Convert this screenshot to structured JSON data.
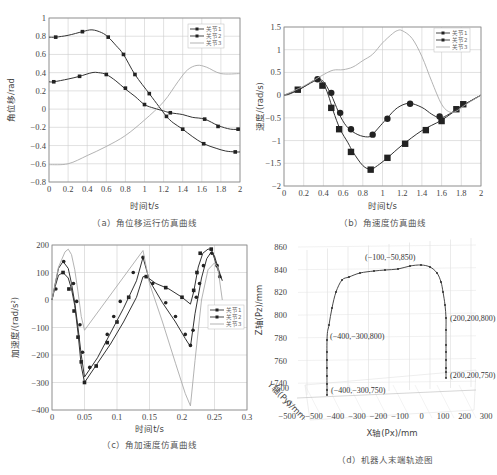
{
  "chart_data": [
    {
      "id": "a",
      "type": "line",
      "title": "角位移运行仿真曲线",
      "caption": "（a）角位移运行仿真曲线",
      "xlabel": "时间t/s",
      "ylabel": "角位移/rad",
      "xlim": [
        0,
        2
      ],
      "ylim": [
        -0.8,
        1
      ],
      "xticks": [
        "0",
        "0.2",
        "0.4",
        "0.6",
        "0.8",
        "1",
        "1.2",
        "1.4",
        "1.6",
        "1.8",
        "2"
      ],
      "yticks": [
        "1",
        "0.8",
        "0.6",
        "0.4",
        "0.2",
        "0",
        "−0.2",
        "−0.4",
        "−0.6",
        "−0.8"
      ],
      "grid": true,
      "legend": {
        "position": "upper-right",
        "entries": [
          "关节1",
          "关节2",
          "关节3"
        ]
      },
      "series": [
        {
          "name": "关节1",
          "marker": "square",
          "x": [
            0.0,
            0.07,
            0.2,
            0.35,
            0.45,
            0.55,
            0.62,
            0.7,
            0.78,
            0.9,
            1.05,
            1.15,
            1.23,
            1.3,
            1.4,
            1.5,
            1.62,
            1.75,
            1.85,
            1.95,
            2.0
          ],
          "y": [
            0.79,
            0.79,
            0.81,
            0.85,
            0.87,
            0.84,
            0.79,
            0.7,
            0.6,
            0.38,
            0.17,
            0.03,
            -0.08,
            -0.15,
            -0.22,
            -0.3,
            -0.38,
            -0.43,
            -0.46,
            -0.47,
            -0.47
          ],
          "markers_x": [
            0.07,
            0.35,
            0.62,
            0.78,
            0.9,
            1.05,
            1.23,
            1.4,
            1.62,
            1.95
          ],
          "markers_y": [
            0.79,
            0.85,
            0.79,
            0.6,
            0.38,
            0.17,
            -0.08,
            -0.22,
            -0.38,
            -0.47
          ]
        },
        {
          "name": "关节2",
          "marker": "square",
          "x": [
            0.0,
            0.05,
            0.2,
            0.32,
            0.45,
            0.52,
            0.6,
            0.7,
            0.8,
            0.9,
            1.0,
            1.1,
            1.2,
            1.27,
            1.4,
            1.5,
            1.63,
            1.77,
            1.9,
            2.0
          ],
          "y": [
            0.3,
            0.3,
            0.33,
            0.36,
            0.4,
            0.4,
            0.38,
            0.31,
            0.22,
            0.14,
            0.05,
            0.01,
            -0.02,
            -0.04,
            -0.06,
            -0.09,
            -0.11,
            -0.18,
            -0.22,
            -0.22
          ],
          "markers_x": [
            0.05,
            0.32,
            0.6,
            0.8,
            1.0,
            1.27,
            1.63,
            1.77,
            1.98
          ],
          "markers_y": [
            0.3,
            0.36,
            0.38,
            0.23,
            0.05,
            -0.04,
            -0.11,
            -0.19,
            -0.22
          ]
        },
        {
          "name": "关节3",
          "marker": "none",
          "x": [
            0.0,
            0.2,
            0.4,
            0.6,
            0.8,
            1.0,
            1.2,
            1.35,
            1.45,
            1.55,
            1.65,
            1.8,
            2.0
          ],
          "y": [
            -0.61,
            -0.6,
            -0.51,
            -0.41,
            -0.29,
            -0.12,
            0.08,
            0.3,
            0.43,
            0.48,
            0.46,
            0.39,
            0.39
          ]
        }
      ]
    },
    {
      "id": "b",
      "type": "line",
      "title": "角速度仿真曲线",
      "caption": "（b）角速度仿真曲线",
      "xlabel": "时间t/s",
      "ylabel": "速度/(rad/s)",
      "xlim": [
        0,
        2
      ],
      "ylim": [
        -2,
        1.5
      ],
      "xticks": [
        "0",
        "0.2",
        "0.4",
        "0.6",
        "0.8",
        "1",
        "1.2",
        "1.4",
        "1.6",
        "1.8",
        "2"
      ],
      "yticks": [
        "1.5",
        "1",
        "0.5",
        "0",
        "−0.5",
        "−1",
        "−1.5",
        "−2"
      ],
      "grid": true,
      "legend": {
        "position": "upper-right",
        "entries": [
          "关节1",
          "关节2",
          "关节3"
        ]
      },
      "series": [
        {
          "name": "关节1",
          "marker": "square",
          "x": [
            0.0,
            0.05,
            0.15,
            0.3,
            0.35,
            0.4,
            0.45,
            0.5,
            0.57,
            0.65,
            0.7,
            0.8,
            0.88,
            0.95,
            1.05,
            1.2,
            1.4,
            1.6,
            1.8,
            1.9,
            2.0
          ],
          "y": [
            0.0,
            0.02,
            0.12,
            0.3,
            0.33,
            0.25,
            0.0,
            -0.35,
            -0.75,
            -1.05,
            -1.25,
            -1.55,
            -1.63,
            -1.55,
            -1.38,
            -1.1,
            -0.78,
            -0.55,
            -0.25,
            -0.12,
            0.0
          ],
          "markers_x": [
            0.14,
            0.39,
            0.48,
            0.56,
            0.68,
            0.88,
            1.05,
            1.23,
            1.44,
            1.6,
            1.75,
            1.82
          ],
          "markers_y": [
            0.12,
            0.21,
            -0.28,
            -0.75,
            -1.25,
            -1.64,
            -1.38,
            -1.07,
            -0.77,
            -0.57,
            -0.31,
            -0.2
          ]
        },
        {
          "name": "关节2",
          "marker": "circle",
          "x": [
            0.0,
            0.15,
            0.3,
            0.34,
            0.4,
            0.47,
            0.52,
            0.58,
            0.65,
            0.75,
            0.85,
            0.9,
            1.0,
            1.05,
            1.15,
            1.27,
            1.4,
            1.5,
            1.58,
            1.65,
            1.8,
            2.0
          ],
          "y": [
            0.0,
            0.12,
            0.32,
            0.35,
            0.3,
            0.05,
            -0.2,
            -0.5,
            -0.72,
            -0.87,
            -0.92,
            -0.86,
            -0.62,
            -0.5,
            -0.28,
            -0.18,
            -0.27,
            -0.42,
            -0.5,
            -0.45,
            -0.25,
            0.0
          ],
          "markers_x": [
            0.34,
            0.48,
            0.57,
            0.68,
            0.9,
            1.05,
            1.28,
            1.58
          ],
          "markers_y": [
            0.35,
            0.05,
            -0.39,
            -0.75,
            -0.87,
            -0.52,
            -0.19,
            -0.47
          ]
        },
        {
          "name": "关节3",
          "marker": "none",
          "x": [
            0.0,
            0.2,
            0.4,
            0.5,
            0.6,
            0.7,
            0.8,
            0.9,
            1.0,
            1.1,
            1.15,
            1.2,
            1.3,
            1.4,
            1.5,
            1.6,
            1.68,
            1.75,
            1.85,
            2.0
          ],
          "y": [
            0.0,
            0.2,
            0.45,
            0.55,
            0.56,
            0.62,
            0.76,
            0.9,
            1.15,
            1.35,
            1.42,
            1.42,
            1.25,
            0.85,
            0.3,
            -0.2,
            -0.37,
            -0.35,
            -0.2,
            0.0
          ]
        }
      ]
    },
    {
      "id": "c",
      "type": "line",
      "title": "角加速度仿真曲线",
      "caption": "（c）角加速度仿真曲线",
      "xlabel": "时间t/s",
      "ylabel": "加速度/(rad/s²)",
      "xlim": [
        0,
        0.3
      ],
      "ylim": [
        -400,
        200
      ],
      "xticks": [
        "0",
        "0.05",
        "0.1",
        "0.15",
        "0.2",
        "0.25",
        "0.3"
      ],
      "yticks": [
        "200",
        "100",
        "0",
        "−100",
        "−200",
        "−300",
        "−400"
      ],
      "grid": true,
      "legend": {
        "position": "center-right",
        "entries": [
          "关节1",
          "关节2",
          "关节3"
        ]
      },
      "series": [
        {
          "name": "关节1",
          "marker": "square",
          "x": [
            0.0,
            0.005,
            0.01,
            0.017,
            0.025,
            0.03,
            0.035,
            0.04,
            0.045,
            0.05,
            0.07,
            0.09,
            0.11,
            0.13,
            0.14,
            0.145,
            0.16,
            0.18,
            0.2,
            0.213,
            0.218,
            0.225,
            0.232,
            0.24,
            0.245,
            0.25,
            0.255,
            0.26
          ],
          "y": [
            0,
            50,
            90,
            100,
            80,
            40,
            -20,
            -120,
            -240,
            -300,
            -230,
            -160,
            -80,
            10,
            85,
            85,
            60,
            40,
            10,
            -15,
            30,
            120,
            170,
            185,
            185,
            150,
            110,
            80
          ],
          "markers_x": [
            0.017,
            0.026,
            0.034,
            0.04,
            0.045,
            0.05,
            0.068,
            0.085,
            0.1,
            0.118,
            0.145,
            0.175,
            0.2,
            0.218,
            0.223,
            0.228,
            0.245
          ],
          "markers_y": [
            100,
            40,
            -40,
            -135,
            -225,
            -300,
            -240,
            -155,
            -80,
            10,
            85,
            45,
            10,
            35,
            100,
            170,
            185
          ]
        },
        {
          "name": "关节2",
          "marker": "circle",
          "x": [
            0.0,
            0.005,
            0.01,
            0.017,
            0.025,
            0.03,
            0.035,
            0.04,
            0.045,
            0.05,
            0.07,
            0.09,
            0.11,
            0.13,
            0.14,
            0.15,
            0.17,
            0.19,
            0.205,
            0.213,
            0.22,
            0.23,
            0.238,
            0.245,
            0.25,
            0.255,
            0.262
          ],
          "y": [
            0,
            60,
            115,
            140,
            115,
            60,
            -10,
            -100,
            -200,
            -280,
            -210,
            -120,
            -30,
            70,
            155,
            70,
            -10,
            -80,
            -140,
            -170,
            -50,
            80,
            150,
            175,
            160,
            120,
            70
          ],
          "markers_x": [
            0.006,
            0.018,
            0.033,
            0.038,
            0.043,
            0.047,
            0.058,
            0.085,
            0.095,
            0.105,
            0.125,
            0.14,
            0.155,
            0.175,
            0.19,
            0.205,
            0.213,
            0.217,
            0.222,
            0.227,
            0.233,
            0.246,
            0.254,
            0.258
          ],
          "markers_y": [
            40,
            140,
            60,
            -5,
            -90,
            -190,
            -245,
            -125,
            -60,
            -5,
            100,
            155,
            60,
            -10,
            -60,
            -125,
            -165,
            -110,
            10,
            60,
            125,
            170,
            125,
            85
          ]
        },
        {
          "name": "关节3",
          "marker": "none",
          "x": [
            0.0,
            0.01,
            0.02,
            0.025,
            0.03,
            0.035,
            0.04,
            0.045,
            0.05,
            0.14,
            0.15,
            0.17,
            0.19,
            0.205,
            0.213,
            0.22,
            0.23,
            0.24,
            0.25,
            0.255,
            0.262
          ],
          "y": [
            0,
            120,
            175,
            185,
            165,
            110,
            30,
            -60,
            -110,
            180,
            60,
            -80,
            -230,
            -340,
            -385,
            -220,
            0,
            110,
            135,
            120,
            0
          ]
        }
      ]
    },
    {
      "id": "d",
      "type": "line3d",
      "title": "机器人末端轨迹图",
      "caption": "（d）机器人末端轨迹图",
      "xlabel": "X轴(Px)/mm",
      "ylabel": "Y轴(Py)/mm",
      "zlabel": "Z轴(Pz)/mm",
      "xlim": [
        -500,
        300
      ],
      "ylim": [
        -500,
        500
      ],
      "zlim": [
        740,
        860
      ],
      "xticks": [
        "−500",
        "−400",
        "−300",
        "−200",
        "−100",
        "0",
        "100",
        "200",
        "300"
      ],
      "yticks": [
        "500",
        "0",
        "−500"
      ],
      "zticks": [
        "860",
        "840",
        "820",
        "800",
        "780",
        "760",
        "740"
      ],
      "grid": true,
      "annotations": [
        {
          "text": "(−100,−50,850)",
          "point": [
            -100,
            -50,
            850
          ]
        },
        {
          "text": "(−400,−300,800)",
          "point": [
            -400,
            -300,
            800
          ]
        },
        {
          "text": "(−400,−300,750)",
          "point": [
            -400,
            -300,
            750
          ]
        },
        {
          "text": "(200,200,800)",
          "point": [
            200,
            200,
            800
          ]
        },
        {
          "text": "(200,200,750)",
          "point": [
            200,
            200,
            750
          ]
        }
      ],
      "series": [
        {
          "name": "末端轨迹",
          "marker": "dot",
          "path": [
            [
              -400,
              -300,
              750
            ],
            [
              -400,
              -300,
              800
            ],
            [
              -350,
              -200,
              830
            ],
            [
              -250,
              -100,
              840
            ],
            [
              -100,
              -50,
              850
            ],
            [
              50,
              50,
              845
            ],
            [
              150,
              150,
              820
            ],
            [
              200,
              200,
              800
            ],
            [
              200,
              200,
              750
            ]
          ]
        }
      ]
    }
  ],
  "legend_labels": {
    "j1": "关节1",
    "j2": "关节2",
    "j3": "关节3"
  },
  "colors": {
    "j1": "#333333",
    "j2": "#333333",
    "j3": "#aaaaaa",
    "grid": "#cccccc",
    "axis": "#888888"
  }
}
